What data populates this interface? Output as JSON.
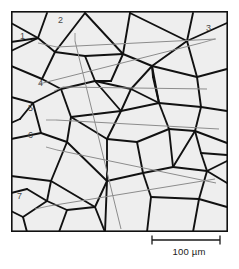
{
  "figure": {
    "kind": "grain-structure-micrograph-schematic",
    "method": "line-intercept",
    "frame": {
      "x": 11,
      "y": 11,
      "width": 217,
      "height": 221,
      "border_color": "#111111",
      "border_width": 1.6,
      "fill_color": "#eeeeee"
    },
    "grain_boundary_color": "#111111",
    "intercept_line_color": "#8c8c8c",
    "label_color": "#4a4a4a"
  },
  "labels": [
    {
      "id": "1",
      "text": "1",
      "x": 20,
      "y": 32
    },
    {
      "id": "2",
      "text": "2",
      "x": 58,
      "y": 16
    },
    {
      "id": "3",
      "text": "3",
      "x": 206,
      "y": 24
    },
    {
      "id": "4",
      "text": "4",
      "x": 38,
      "y": 79
    },
    {
      "id": "5",
      "text": "5",
      "x": 28,
      "y": 104
    },
    {
      "id": "6",
      "text": "6",
      "x": 28,
      "y": 131
    },
    {
      "id": "7",
      "text": "7",
      "x": 17,
      "y": 192
    }
  ],
  "scale_bar": {
    "label": "100 µm",
    "value": 100,
    "unit": "µm",
    "bar_x1": 155,
    "bar_x2": 223,
    "bar_y": 240,
    "cap_height": 9,
    "color": "#1a1a1a"
  },
  "chart_data": {
    "type": "diagram",
    "title": "",
    "grain_boundaries": [
      [
        [
          0,
          31
        ],
        [
          27,
          27
        ],
        [
          44,
          41
        ]
      ],
      [
        [
          44,
          41
        ],
        [
          74,
          2
        ]
      ],
      [
        [
          44,
          41
        ],
        [
          31,
          68
        ]
      ],
      [
        [
          0,
          55
        ],
        [
          31,
          68
        ]
      ],
      [
        [
          31,
          68
        ],
        [
          50,
          78
        ]
      ],
      [
        [
          0,
          86
        ],
        [
          22,
          92
        ]
      ],
      [
        [
          22,
          92
        ],
        [
          50,
          78
        ]
      ],
      [
        [
          22,
          92
        ],
        [
          30,
          122
        ]
      ],
      [
        [
          0,
          128
        ],
        [
          30,
          122
        ]
      ],
      [
        [
          30,
          122
        ],
        [
          56,
          131
        ]
      ],
      [
        [
          50,
          78
        ],
        [
          60,
          106
        ]
      ],
      [
        [
          60,
          106
        ],
        [
          56,
          131
        ]
      ],
      [
        [
          56,
          131
        ],
        [
          40,
          170
        ]
      ],
      [
        [
          0,
          165
        ],
        [
          40,
          170
        ]
      ],
      [
        [
          40,
          170
        ],
        [
          36,
          190
        ]
      ],
      [
        [
          36,
          190
        ],
        [
          12,
          206
        ]
      ],
      [
        [
          36,
          190
        ],
        [
          56,
          199
        ]
      ],
      [
        [
          56,
          199
        ],
        [
          48,
          221
        ]
      ],
      [
        [
          56,
          199
        ],
        [
          84,
          196
        ]
      ],
      [
        [
          40,
          170
        ],
        [
          84,
          196
        ]
      ],
      [
        [
          84,
          196
        ],
        [
          94,
          221
        ]
      ],
      [
        [
          84,
          196
        ],
        [
          96,
          170
        ]
      ],
      [
        [
          56,
          131
        ],
        [
          96,
          170
        ]
      ],
      [
        [
          60,
          106
        ],
        [
          96,
          128
        ]
      ],
      [
        [
          96,
          128
        ],
        [
          96,
          170
        ]
      ],
      [
        [
          96,
          128
        ],
        [
          110,
          100
        ]
      ],
      [
        [
          60,
          106
        ],
        [
          110,
          100
        ]
      ],
      [
        [
          110,
          100
        ],
        [
          84,
          70
        ]
      ],
      [
        [
          50,
          78
        ],
        [
          84,
          70
        ]
      ],
      [
        [
          84,
          70
        ],
        [
          74,
          45
        ]
      ],
      [
        [
          44,
          41
        ],
        [
          74,
          45
        ]
      ],
      [
        [
          74,
          45
        ],
        [
          112,
          43
        ]
      ],
      [
        [
          74,
          2
        ],
        [
          112,
          43
        ]
      ],
      [
        [
          112,
          43
        ],
        [
          141,
          55
        ]
      ],
      [
        [
          84,
          70
        ],
        [
          120,
          78
        ]
      ],
      [
        [
          120,
          78
        ],
        [
          141,
          55
        ]
      ],
      [
        [
          110,
          100
        ],
        [
          120,
          78
        ]
      ],
      [
        [
          120,
          78
        ],
        [
          148,
          92
        ]
      ],
      [
        [
          110,
          100
        ],
        [
          148,
          92
        ]
      ],
      [
        [
          148,
          92
        ],
        [
          141,
          55
        ]
      ],
      [
        [
          141,
          55
        ],
        [
          176,
          30
        ]
      ],
      [
        [
          112,
          43
        ],
        [
          119,
          2
        ]
      ],
      [
        [
          119,
          2
        ],
        [
          176,
          30
        ]
      ],
      [
        [
          176,
          30
        ],
        [
          216,
          12
        ]
      ],
      [
        [
          176,
          30
        ],
        [
          186,
          66
        ]
      ],
      [
        [
          141,
          55
        ],
        [
          186,
          66
        ]
      ],
      [
        [
          186,
          66
        ],
        [
          216,
          58
        ]
      ],
      [
        [
          186,
          66
        ],
        [
          190,
          96
        ]
      ],
      [
        [
          148,
          92
        ],
        [
          190,
          96
        ]
      ],
      [
        [
          190,
          96
        ],
        [
          216,
          100
        ]
      ],
      [
        [
          190,
          96
        ],
        [
          184,
          120
        ]
      ],
      [
        [
          148,
          92
        ],
        [
          158,
          118
        ]
      ],
      [
        [
          158,
          118
        ],
        [
          184,
          120
        ]
      ],
      [
        [
          96,
          128
        ],
        [
          126,
          131
        ]
      ],
      [
        [
          126,
          131
        ],
        [
          158,
          118
        ]
      ],
      [
        [
          126,
          131
        ],
        [
          132,
          162
        ]
      ],
      [
        [
          96,
          170
        ],
        [
          132,
          162
        ]
      ],
      [
        [
          132,
          162
        ],
        [
          162,
          156
        ]
      ],
      [
        [
          158,
          118
        ],
        [
          162,
          156
        ]
      ],
      [
        [
          162,
          156
        ],
        [
          184,
          120
        ]
      ],
      [
        [
          184,
          120
        ],
        [
          216,
          132
        ]
      ],
      [
        [
          162,
          156
        ],
        [
          196,
          160
        ]
      ],
      [
        [
          196,
          160
        ],
        [
          216,
          150
        ]
      ],
      [
        [
          196,
          160
        ],
        [
          188,
          188
        ]
      ],
      [
        [
          132,
          162
        ],
        [
          140,
          186
        ]
      ],
      [
        [
          140,
          186
        ],
        [
          188,
          188
        ]
      ],
      [
        [
          140,
          186
        ],
        [
          136,
          221
        ]
      ],
      [
        [
          188,
          188
        ],
        [
          182,
          221
        ]
      ],
      [
        [
          188,
          188
        ],
        [
          216,
          196
        ]
      ],
      [
        [
          148,
          92
        ],
        [
          142,
          66
        ]
      ],
      [
        [
          142,
          66
        ],
        [
          141,
          55
        ]
      ],
      [
        [
          94,
          221
        ],
        [
          96,
          170
        ]
      ],
      [
        [
          112,
          43
        ],
        [
          100,
          70
        ]
      ],
      [
        [
          100,
          70
        ],
        [
          84,
          70
        ]
      ],
      [
        [
          0,
          12
        ],
        [
          27,
          27
        ]
      ],
      [
        [
          27,
          27
        ],
        [
          36,
          2
        ]
      ],
      [
        [
          0,
          40
        ],
        [
          27,
          27
        ]
      ],
      [
        [
          22,
          92
        ],
        [
          9,
          108
        ]
      ],
      [
        [
          9,
          108
        ],
        [
          0,
          112
        ]
      ],
      [
        [
          36,
          190
        ],
        [
          16,
          178
        ]
      ],
      [
        [
          16,
          178
        ],
        [
          0,
          182
        ]
      ],
      [
        [
          12,
          206
        ],
        [
          0,
          200
        ]
      ],
      [
        [
          12,
          206
        ],
        [
          16,
          221
        ]
      ],
      [
        [
          176,
          30
        ],
        [
          182,
          2
        ]
      ],
      [
        [
          216,
          172
        ],
        [
          196,
          160
        ]
      ],
      [
        [
          184,
          120
        ],
        [
          190,
          142
        ]
      ],
      [
        [
          190,
          142
        ],
        [
          216,
          144
        ]
      ],
      [
        [
          190,
          142
        ],
        [
          196,
          160
        ]
      ]
    ],
    "intercept_lines": [
      {
        "n": 1,
        "leader": [
          [
            27,
            32
          ],
          [
            46,
            36
          ]
        ],
        "line": [
          [
            46,
            36
          ],
          [
            205,
            28
          ]
        ]
      },
      {
        "n": 2,
        "leader": [
          [
            64,
            22
          ],
          [
            64,
            30
          ]
        ],
        "line": [
          [
            64,
            30
          ],
          [
            110,
            218
          ]
        ]
      },
      {
        "n": 3,
        "leader": [
          [
            204,
            28
          ],
          [
            190,
            32
          ]
        ],
        "line": [
          [
            190,
            32
          ],
          [
            28,
            73
          ]
        ]
      },
      {
        "n": 4,
        "leader": [
          [
            43,
            80
          ],
          [
            52,
            76
          ]
        ],
        "line": [
          [
            52,
            76
          ],
          [
            196,
            78
          ]
        ]
      },
      {
        "n": 5,
        "leader": [
          [
            35,
            109
          ],
          [
            45,
            109
          ]
        ],
        "line": [
          [
            45,
            109
          ],
          [
            208,
            118
          ]
        ]
      },
      {
        "n": 6,
        "leader": [
          [
            35,
            136
          ],
          [
            46,
            139
          ]
        ],
        "line": [
          [
            46,
            139
          ],
          [
            205,
            172
          ]
        ]
      },
      {
        "n": 7,
        "leader": [
          [
            24,
            198
          ],
          [
            38,
            195
          ]
        ],
        "line": [
          [
            38,
            195
          ],
          [
            204,
            168
          ]
        ]
      }
    ]
  }
}
